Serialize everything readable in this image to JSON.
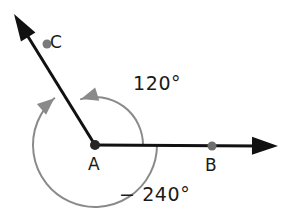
{
  "figure": {
    "type": "geometry-angle-diagram",
    "background_color": "#ffffff",
    "vertex": {
      "name": "A",
      "label": "A",
      "x": 95,
      "y": 145,
      "dot_color": "#262626",
      "dot_radius": 5
    },
    "rays": [
      {
        "name": "ray-AB",
        "from": "A",
        "through_point": "B",
        "direction_degrees": 0,
        "color": "#111111",
        "stroke_width": 3,
        "tip_x": 278,
        "tip_y": 146,
        "arrowhead": "solid-triangle",
        "point": {
          "label": "B",
          "x": 212,
          "y": 146,
          "dot_color": "#6e6e6e",
          "dot_radius": 4.5
        }
      },
      {
        "name": "ray-AC",
        "from": "A",
        "through_point": "C",
        "direction_degrees": 120,
        "color": "#111111",
        "stroke_width": 3,
        "tip_x": 14,
        "tip_y": 14,
        "arrowhead": "solid-triangle",
        "point": {
          "label": "C",
          "x": 47,
          "y": 44,
          "dot_color": "#7a7a7a",
          "dot_radius": 4.5
        }
      }
    ],
    "arcs": [
      {
        "name": "inner-arc-120",
        "label": "120°",
        "measure_degrees": 120,
        "radius": 48,
        "start_degrees": 0,
        "end_degrees": 120,
        "direction": "counterclockwise",
        "color": "#8a8a8a",
        "stroke_width": 2,
        "arrow_at": "end",
        "arrowhead_color": "#8a8a8a"
      },
      {
        "name": "outer-arc-minus-240",
        "label": "− 240°",
        "measure_degrees": -240,
        "radius": 62,
        "start_degrees": 0,
        "end_degrees": -240,
        "direction": "clockwise",
        "color": "#8a8a8a",
        "stroke_width": 2,
        "arrow_at": "end",
        "arrowhead_color": "#8a8a8a"
      }
    ]
  },
  "labels": {
    "point_c": "C",
    "point_a": "A",
    "point_b": "B",
    "angle_inner": "120°",
    "angle_outer": "− 240°"
  }
}
